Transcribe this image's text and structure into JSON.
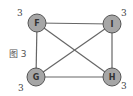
{
  "caption": "图 3",
  "colors": {
    "node_fill": "#a6a6a6",
    "node_stroke": "#555555",
    "edge": "#666666"
  },
  "nodes": [
    {
      "id": "F",
      "label": "F",
      "x": 37,
      "y": 23,
      "degree": "3",
      "degree_x": 17,
      "degree_y": 16
    },
    {
      "id": "I",
      "label": "I",
      "x": 112,
      "y": 24,
      "degree": "3",
      "degree_x": 121,
      "degree_y": 16
    },
    {
      "id": "G",
      "label": "G",
      "x": 36,
      "y": 77,
      "degree": "3",
      "degree_x": 18,
      "degree_y": 91
    },
    {
      "id": "H",
      "label": "H",
      "x": 112,
      "y": 77,
      "degree": "3",
      "degree_x": 121,
      "degree_y": 89
    }
  ],
  "edges": [
    [
      "F",
      "I"
    ],
    [
      "F",
      "G"
    ],
    [
      "F",
      "H"
    ],
    [
      "I",
      "G"
    ],
    [
      "I",
      "H"
    ],
    [
      "G",
      "H"
    ]
  ]
}
